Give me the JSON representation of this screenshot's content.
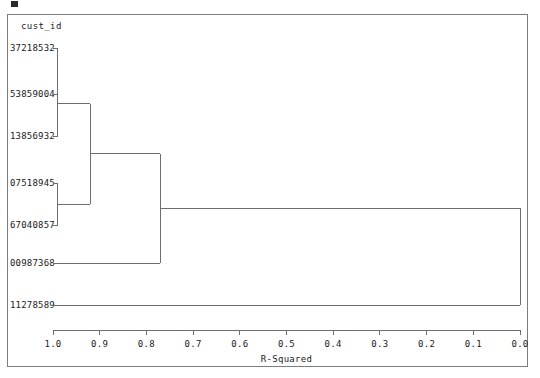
{
  "header": {
    "column_label": "cust_id"
  },
  "chart_data": {
    "type": "dendrogram",
    "title": "",
    "xlabel": "R-Squared",
    "ylabel": "cust_id",
    "xlim": [
      1.0,
      0.0
    ],
    "x_tick_labels": [
      "1.0",
      "0.9",
      "0.8",
      "0.7",
      "0.6",
      "0.5",
      "0.4",
      "0.3",
      "0.2",
      "0.1",
      "0.0"
    ],
    "x_tick_values": [
      1.0,
      0.9,
      0.8,
      0.7,
      0.6,
      0.5,
      0.4,
      0.3,
      0.2,
      0.1,
      0.0
    ],
    "axis_direction": "reversed",
    "grid": false,
    "legend": "none",
    "leaves": [
      {
        "label": "37218532",
        "order": 0
      },
      {
        "label": "53859004",
        "order": 1
      },
      {
        "label": "13856932",
        "order": 2
      },
      {
        "label": "07518945",
        "order": 3
      },
      {
        "label": "67040857",
        "order": 4
      },
      {
        "label": "00987368",
        "order": 5
      },
      {
        "label": "11278589",
        "order": 6
      }
    ],
    "merges": [
      {
        "id": "m1",
        "members": [
          "37218532",
          "53859004"
        ],
        "r_squared": 0.99
      },
      {
        "id": "m2",
        "members": [
          "m1",
          "13856932"
        ],
        "r_squared": 0.99
      },
      {
        "id": "m3",
        "members": [
          "07518945",
          "67040857"
        ],
        "r_squared": 0.99
      },
      {
        "id": "m4",
        "members": [
          "m2",
          "m3"
        ],
        "r_squared": 0.92
      },
      {
        "id": "m5",
        "members": [
          "m4",
          "00987368"
        ],
        "r_squared": 0.77
      },
      {
        "id": "m6",
        "members": [
          "m5",
          "11278589"
        ],
        "r_squared": 0.0
      }
    ],
    "line_color": "#6e6e6e",
    "frame_color": "#7d7d7d",
    "background": "#ffffff"
  },
  "axis": {
    "title": "R-Squared",
    "ticks": [
      "1.0",
      "0.9",
      "0.8",
      "0.7",
      "0.6",
      "0.5",
      "0.4",
      "0.3",
      "0.2",
      "0.1",
      "0.0"
    ]
  }
}
